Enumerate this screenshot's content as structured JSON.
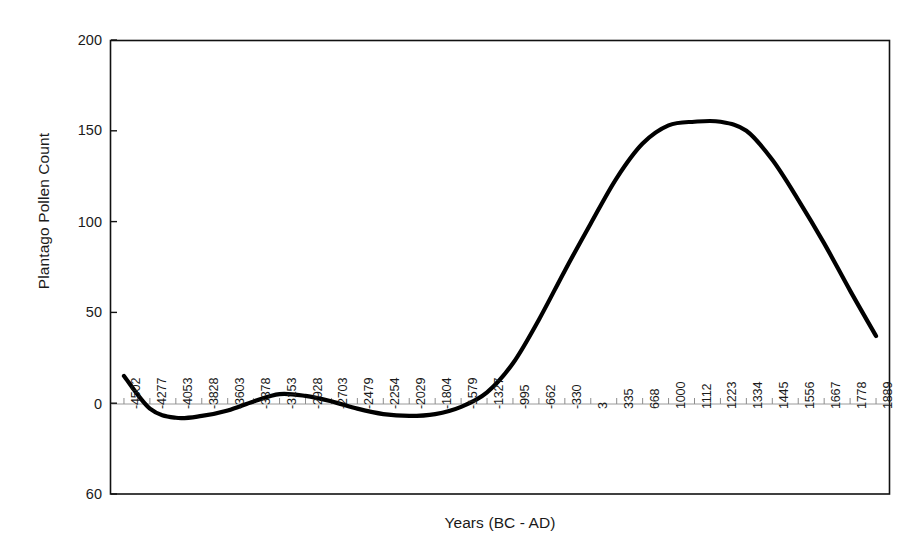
{
  "chart_data": {
    "type": "line",
    "title": "",
    "xlabel": "Years (BC - AD)",
    "ylabel": "Plantago Pollen Count",
    "ylim": [
      -50,
      200
    ],
    "yticks": [
      200,
      150,
      100,
      50,
      0,
      -50
    ],
    "ytick_labels": [
      "200",
      "150",
      "100",
      "50",
      "0",
      "60"
    ],
    "grid": false,
    "legend": null,
    "zero_line": true,
    "line_color": "#000000",
    "line_width": 4,
    "categories": [
      "-4502",
      "-4277",
      "-4053",
      "-3828",
      "-3603",
      "-3378",
      "-3153",
      "-2928",
      "-2703",
      "-2479",
      "-2254",
      "-2029",
      "-1804",
      "-1579",
      "-1327",
      "-995",
      "-662",
      "-330",
      "3",
      "335",
      "668",
      "1000",
      "1112",
      "1223",
      "1334",
      "1445",
      "1556",
      "1667",
      "1778",
      "1889"
    ],
    "x": [
      -4502,
      -4277,
      -4053,
      -3828,
      -3603,
      -3378,
      -3153,
      -2928,
      -2703,
      -2479,
      -2254,
      -2029,
      -1804,
      -1579,
      -1327,
      -995,
      -662,
      -330,
      3,
      335,
      668,
      1000,
      1112,
      1223,
      1334,
      1445,
      1556,
      1667,
      1778,
      1889
    ],
    "values": [
      15,
      -3,
      -8,
      -7,
      -4,
      1,
      5,
      4,
      1,
      -3,
      -6,
      -7,
      -6,
      -2,
      6,
      22,
      46,
      73,
      99,
      124,
      143,
      153,
      155,
      155,
      150,
      134,
      112,
      88,
      62,
      37
    ]
  },
  "axes": {
    "x_title": "Years (BC - AD)",
    "y_title": "Plantago Pollen Count"
  }
}
